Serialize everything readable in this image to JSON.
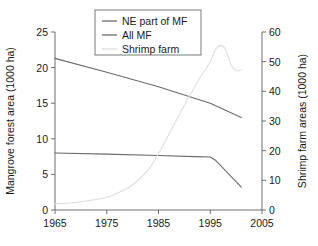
{
  "chart_data": {
    "type": "line",
    "title": "",
    "xlabel": "",
    "ylabel": "Mangrove forest area (1000 ha)",
    "y2label": "Shrimp farm areas (1000 ha)",
    "xlim": [
      1965,
      2005
    ],
    "ylim": [
      0,
      25
    ],
    "y2lim": [
      0,
      60
    ],
    "xticks": [
      1965,
      1975,
      1985,
      1995,
      2005
    ],
    "xticklabels": [
      "1965",
      "1975",
      "1985",
      "1995",
      "2005"
    ],
    "yticks": [
      0,
      5,
      10,
      15,
      20,
      25
    ],
    "yticklabels": [
      "0",
      "5",
      "10",
      "15",
      "20",
      "25"
    ],
    "y2ticks": [
      0,
      10,
      20,
      30,
      40,
      50,
      60
    ],
    "y2ticklabels": [
      "0",
      "10",
      "20",
      "30",
      "40",
      "50",
      "60"
    ],
    "grid": false,
    "legend_position": "top-center",
    "series": [
      {
        "name": "NE part of MF",
        "axis": "left",
        "color": "#6b6b6b",
        "x": [
          1965,
          1975,
          1985,
          1992,
          1995,
          1996,
          2001
        ],
        "values": [
          8.0,
          7.85,
          7.65,
          7.5,
          7.45,
          7.0,
          3.2
        ]
      },
      {
        "name": "All MF",
        "axis": "left",
        "color": "#6b6b6b",
        "x": [
          1965,
          1975,
          1985,
          1995,
          2001
        ],
        "values": [
          21.3,
          19.35,
          17.3,
          15.0,
          13.0
        ]
      },
      {
        "name": "Shrimp farm",
        "axis": "right",
        "color": "#dedede",
        "x": [
          1965,
          1970,
          1975,
          1978,
          1980,
          1983,
          1985,
          1987,
          1989,
          1991,
          1993,
          1995,
          1996,
          1997,
          1998,
          1999,
          2000,
          2001
        ],
        "values": [
          2.0,
          2.8,
          4.2,
          6.5,
          8.5,
          13.5,
          19.0,
          25.5,
          32.0,
          38.5,
          44.5,
          50.0,
          54.0,
          55.5,
          54.0,
          49.0,
          47.0,
          47.2
        ]
      }
    ]
  },
  "legend": {
    "entries": [
      {
        "label": "NE part of MF"
      },
      {
        "label": "All MF"
      },
      {
        "label": "Shrimp farm"
      }
    ]
  }
}
